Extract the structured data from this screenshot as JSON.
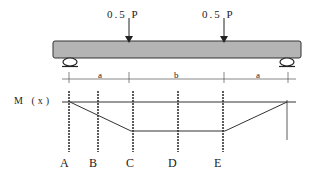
{
  "diagram": {
    "type": "beam four-point bending with moment diagram",
    "loads": [
      {
        "label": "0.5 P",
        "x": 129
      },
      {
        "label": "0.5 P",
        "x": 224
      }
    ],
    "dimensions": [
      {
        "label": "a",
        "from": 69,
        "to": 129
      },
      {
        "label": "b",
        "from": 129,
        "to": 224
      },
      {
        "label": "a",
        "from": 224,
        "to": 288
      }
    ],
    "moment_axis_label": "M (x)",
    "sections": [
      {
        "label": "A",
        "x": 69
      },
      {
        "label": "B",
        "x": 98
      },
      {
        "label": "C",
        "x": 133
      },
      {
        "label": "D",
        "x": 178
      },
      {
        "label": "E",
        "x": 223
      }
    ],
    "colors": {
      "beam_fill": "#b4b4b4",
      "beam_stroke": "#333333",
      "line": "#333333"
    }
  }
}
